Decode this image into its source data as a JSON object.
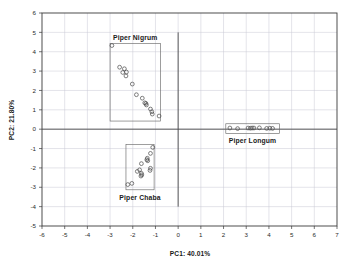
{
  "chart_data": {
    "type": "scatter",
    "title": "",
    "xlabel": "PC1: 40.01%",
    "ylabel": "PC2: 21.80%",
    "xlim": [
      -6,
      7
    ],
    "ylim": [
      -5,
      6
    ],
    "xticks": [
      -6,
      -5,
      -4,
      -3,
      -2,
      -1,
      0,
      1,
      2,
      3,
      4,
      5,
      6,
      7
    ],
    "yticks": [
      -5,
      -4,
      -3,
      -2,
      -1,
      0,
      1,
      2,
      3,
      4,
      5,
      6
    ],
    "xtick_labels": [
      "-6",
      "-5",
      "-4",
      "-3",
      "-2",
      "-1",
      "0",
      "1",
      "2",
      "3",
      "4",
      "5",
      "6",
      "7"
    ],
    "ytick_labels": [
      "-5",
      "-4",
      "-3",
      "-2",
      "-1",
      "0",
      "1",
      "2",
      "3",
      "4",
      "5",
      "6"
    ],
    "grid": true,
    "legend_position": "none",
    "marker_style": "open-circle",
    "zero_lines": {
      "x": 0,
      "y": 0
    },
    "series": [
      {
        "name": "Piper Nigrum",
        "label_position": "above-box",
        "box": {
          "xmin": -3.0,
          "xmax": -0.78,
          "ymin": 0.42,
          "ymax": 4.42
        },
        "points": [
          {
            "x": -2.92,
            "y": 4.32
          },
          {
            "x": -2.58,
            "y": 3.2
          },
          {
            "x": -2.37,
            "y": 3.12
          },
          {
            "x": -2.44,
            "y": 2.93
          },
          {
            "x": -2.28,
            "y": 2.95
          },
          {
            "x": -2.3,
            "y": 2.75
          },
          {
            "x": -2.02,
            "y": 2.33
          },
          {
            "x": -1.84,
            "y": 1.78
          },
          {
            "x": -1.58,
            "y": 1.6
          },
          {
            "x": -1.47,
            "y": 1.36
          },
          {
            "x": -1.42,
            "y": 1.33
          },
          {
            "x": -1.4,
            "y": 1.25
          },
          {
            "x": -1.22,
            "y": 1.04
          },
          {
            "x": -1.16,
            "y": 0.9
          },
          {
            "x": -1.14,
            "y": 0.78
          },
          {
            "x": -0.84,
            "y": 0.68
          }
        ]
      },
      {
        "name": "Piper Chaba",
        "label_position": "below-box",
        "box": {
          "xmin": -2.3,
          "xmax": -1.06,
          "ymin": -3.13,
          "ymax": -0.8
        },
        "points": [
          {
            "x": -1.12,
            "y": -0.94
          },
          {
            "x": -1.22,
            "y": -1.25
          },
          {
            "x": -1.36,
            "y": -1.5
          },
          {
            "x": -1.38,
            "y": -1.58
          },
          {
            "x": -1.34,
            "y": -1.63
          },
          {
            "x": -1.62,
            "y": -1.78
          },
          {
            "x": -1.22,
            "y": -2.02
          },
          {
            "x": -1.24,
            "y": -2.13
          },
          {
            "x": -1.7,
            "y": -2.1
          },
          {
            "x": -1.8,
            "y": -2.18
          },
          {
            "x": -1.62,
            "y": -2.28
          },
          {
            "x": -1.6,
            "y": -2.36
          },
          {
            "x": -1.64,
            "y": -2.42
          },
          {
            "x": -2.22,
            "y": -2.86
          },
          {
            "x": -2.04,
            "y": -2.8
          }
        ]
      },
      {
        "name": "Piper Longum",
        "label_position": "below-box",
        "box": {
          "xmin": 2.1,
          "xmax": 4.46,
          "ymin": -0.22,
          "ymax": 0.28
        },
        "points": [
          {
            "x": 2.28,
            "y": 0.06
          },
          {
            "x": 2.62,
            "y": 0.03
          },
          {
            "x": 3.08,
            "y": 0.06
          },
          {
            "x": 3.18,
            "y": 0.05
          },
          {
            "x": 3.26,
            "y": 0.06
          },
          {
            "x": 3.34,
            "y": 0.06
          },
          {
            "x": 3.58,
            "y": 0.07
          },
          {
            "x": 3.9,
            "y": 0.04
          },
          {
            "x": 4.04,
            "y": 0.05
          },
          {
            "x": 4.16,
            "y": 0.04
          }
        ]
      }
    ]
  }
}
